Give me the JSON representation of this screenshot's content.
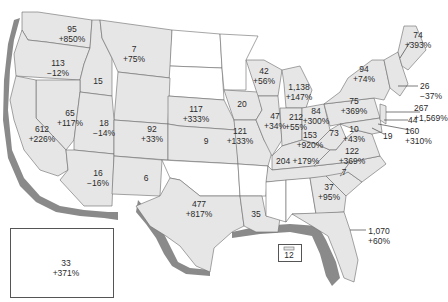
{
  "map": {
    "colors": {
      "fill": "#e6e6e6",
      "shadow": "#8a8a8a",
      "border": "#6a6a6a",
      "blank": "#ffffff",
      "text": "#2a2a2a"
    },
    "states": [
      {
        "id": "WA",
        "value": "95",
        "change": "+850%"
      },
      {
        "id": "OR",
        "value": "113",
        "change": "−12%"
      },
      {
        "id": "ID",
        "value": "15",
        "change": ""
      },
      {
        "id": "MT",
        "value": "7",
        "change": "+75%"
      },
      {
        "id": "NV",
        "value": "65",
        "change": "+117%"
      },
      {
        "id": "CA",
        "value": "612",
        "change": "+226%"
      },
      {
        "id": "UT",
        "value": "18",
        "change": "−14%"
      },
      {
        "id": "AZ",
        "value": "16",
        "change": "−16%"
      },
      {
        "id": "CO",
        "value": "92",
        "change": "+33%"
      },
      {
        "id": "NM",
        "value": "6",
        "change": ""
      },
      {
        "id": "NE",
        "value": "117",
        "change": "+333%"
      },
      {
        "id": "KS",
        "value": "9",
        "change": ""
      },
      {
        "id": "TX",
        "value": "477",
        "change": "+817%"
      },
      {
        "id": "IA",
        "value": "20",
        "change": ""
      },
      {
        "id": "MO",
        "value": "121",
        "change": "+133%"
      },
      {
        "id": "LA",
        "value": "35",
        "change": ""
      },
      {
        "id": "WI",
        "value": "42",
        "change": "+56%"
      },
      {
        "id": "IL",
        "value": "47",
        "change": "+34%"
      },
      {
        "id": "MI",
        "value": "1,138",
        "change": "+147%"
      },
      {
        "id": "IN",
        "value": "212",
        "change": "+55%"
      },
      {
        "id": "OH",
        "value": "84",
        "change": "+300%"
      },
      {
        "id": "KY",
        "value": "153",
        "change": "+920%"
      },
      {
        "id": "TN",
        "value": "204",
        "change": "+179%"
      },
      {
        "id": "WV",
        "value": "73",
        "change": ""
      },
      {
        "id": "VA",
        "value": "10",
        "change": "+43%"
      },
      {
        "id": "NC",
        "value": "122",
        "change": "+369%"
      },
      {
        "id": "SC",
        "value": "7",
        "change": ""
      },
      {
        "id": "GA",
        "value": "37",
        "change": "+95%"
      },
      {
        "id": "FL",
        "value": "1,070",
        "change": "+60%"
      },
      {
        "id": "PA",
        "value": "75",
        "change": "+369%"
      },
      {
        "id": "NY",
        "value": "94",
        "change": "+74%"
      },
      {
        "id": "ME",
        "value": "74",
        "change": "+393%"
      },
      {
        "id": "MA",
        "value": "26",
        "change": "−37%"
      },
      {
        "id": "NJ",
        "value": "267",
        "change": "+1,569%"
      },
      {
        "id": "DE",
        "value": "44",
        "change": ""
      },
      {
        "id": "MD",
        "value": "160",
        "change": "+310%"
      },
      {
        "id": "DC",
        "value": "19",
        "change": ""
      },
      {
        "id": "HI",
        "value": "33",
        "change": "+371%"
      },
      {
        "id": "PR",
        "value": "12",
        "change": ""
      }
    ]
  }
}
